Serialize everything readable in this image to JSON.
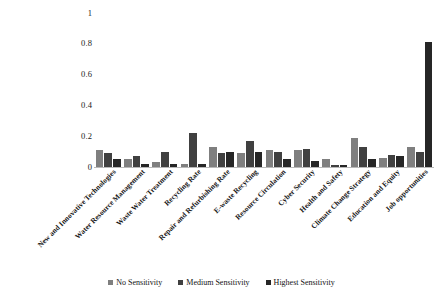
{
  "chart_data": {
    "type": "bar",
    "title": "",
    "subtitle": "",
    "xlabel": "",
    "ylabel": "",
    "ylim": [
      0,
      1
    ],
    "yticks": [
      0,
      0.2,
      0.4,
      0.6,
      0.8,
      1
    ],
    "ytick_labels": [
      "0",
      "0.2",
      "0.4",
      "0.6",
      "0.8",
      "1"
    ],
    "grid": false,
    "legend_position": "bottom",
    "orientation": "vertical",
    "grouping": "grouped",
    "categories": [
      "New and Innovative Technologies",
      "Water Resource Management",
      "Waste Water Treatment",
      "Recycling Rate",
      "Repair and Refurbishing Rate",
      "E-waste Recycling",
      "Resource Circulation",
      "Cyber Security",
      "Health and Safety",
      "Climate Change Strategy",
      "Education and Equity",
      "Job opportunities"
    ],
    "series": [
      {
        "name": "No Sensitivity",
        "color": "#7f7f7f",
        "values": [
          0.11,
          0.05,
          0.03,
          0.02,
          0.13,
          0.09,
          0.11,
          0.11,
          0.05,
          0.19,
          0.06,
          0.13
        ]
      },
      {
        "name": "Medium Sensitivity",
        "color": "#404040",
        "values": [
          0.09,
          0.07,
          0.1,
          0.22,
          0.09,
          0.17,
          0.1,
          0.12,
          0.01,
          0.13,
          0.08,
          0.1
        ]
      },
      {
        "name": "Highest Sensitivity",
        "color": "#262626",
        "values": [
          0.05,
          0.02,
          0.02,
          0.02,
          0.1,
          0.1,
          0.05,
          0.04,
          0.01,
          0.05,
          0.07,
          0.81
        ]
      }
    ],
    "data_points": [
      {
        "category": "New and Innovative Technologies",
        "No Sensitivity": 0.11,
        "Medium Sensitivity": 0.09,
        "Highest Sensitivity": 0.05
      },
      {
        "category": "Water Resource Management",
        "No Sensitivity": 0.05,
        "Medium Sensitivity": 0.07,
        "Highest Sensitivity": 0.02
      },
      {
        "category": "Waste Water Treatment",
        "No Sensitivity": 0.03,
        "Medium Sensitivity": 0.1,
        "Highest Sensitivity": 0.02
      },
      {
        "category": "Recycling Rate",
        "No Sensitivity": 0.02,
        "Medium Sensitivity": 0.22,
        "Highest Sensitivity": 0.02
      },
      {
        "category": "Repair and Refurbishing Rate",
        "No Sensitivity": 0.13,
        "Medium Sensitivity": 0.09,
        "Highest Sensitivity": 0.1
      },
      {
        "category": "E-waste Recycling",
        "No Sensitivity": 0.09,
        "Medium Sensitivity": 0.17,
        "Highest Sensitivity": 0.1
      },
      {
        "category": "Resource Circulation",
        "No Sensitivity": 0.11,
        "Medium Sensitivity": 0.1,
        "Highest Sensitivity": 0.05
      },
      {
        "category": "Cyber Security",
        "No Sensitivity": 0.11,
        "Medium Sensitivity": 0.12,
        "Highest Sensitivity": 0.04
      },
      {
        "category": "Health and Safety",
        "No Sensitivity": 0.05,
        "Medium Sensitivity": 0.01,
        "Highest Sensitivity": 0.01
      },
      {
        "category": "Climate Change Strategy",
        "No Sensitivity": 0.19,
        "Medium Sensitivity": 0.13,
        "Highest Sensitivity": 0.05
      },
      {
        "category": "Education and Equity",
        "No Sensitivity": 0.06,
        "Medium Sensitivity": 0.08,
        "Highest Sensitivity": 0.07
      },
      {
        "category": "Job opportunities",
        "No Sensitivity": 0.13,
        "Medium Sensitivity": 0.1,
        "Highest Sensitivity": 0.81
      }
    ]
  },
  "legend": {
    "items": [
      {
        "label": "No Sensitivity",
        "color": "#7f7f7f"
      },
      {
        "label": "Medium Sensitivity",
        "color": "#404040"
      },
      {
        "label": "Highest Sensitivity",
        "color": "#262626"
      }
    ]
  }
}
